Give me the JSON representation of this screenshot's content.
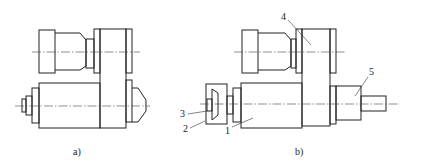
{
  "figure": {
    "subfigures": [
      {
        "id": "a",
        "caption": "a)"
      },
      {
        "id": "b",
        "caption": "b)"
      }
    ],
    "part_labels": [
      {
        "number": "1"
      },
      {
        "number": "2"
      },
      {
        "number": "3"
      },
      {
        "number": "4"
      },
      {
        "number": "5"
      }
    ]
  }
}
